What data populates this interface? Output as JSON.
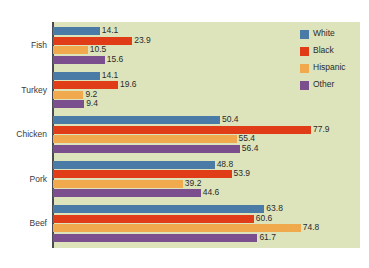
{
  "chart_data": {
    "type": "bar",
    "orientation": "horizontal",
    "title": "",
    "xlabel": "",
    "ylabel": "",
    "categories": [
      "Fish",
      "Turkey",
      "Chicken",
      "Pork",
      "Beef"
    ],
    "series": [
      {
        "name": "White",
        "color": "#4a7ba7",
        "values": [
          14.1,
          14.1,
          50.4,
          48.8,
          63.8
        ]
      },
      {
        "name": "Black",
        "color": "#e03c18",
        "values": [
          23.9,
          19.6,
          77.9,
          53.9,
          60.6
        ]
      },
      {
        "name": "Hispanic",
        "color": "#f0a94c",
        "values": [
          10.5,
          9.2,
          55.4,
          39.2,
          74.8
        ]
      },
      {
        "name": "Other",
        "color": "#7b4f8e",
        "values": [
          15.6,
          9.4,
          56.4,
          44.6,
          61.7
        ]
      }
    ],
    "xlim": [
      0,
      80
    ],
    "grid": false,
    "legend_position": "top-right",
    "plot_background": "#dde4bc",
    "data_labels": true
  },
  "legend": {
    "items": [
      {
        "label": "White",
        "color": "#4a7ba7"
      },
      {
        "label": "Black",
        "color": "#e03c18"
      },
      {
        "label": "Hispanic",
        "color": "#f0a94c"
      },
      {
        "label": "Other",
        "color": "#7b4f8e"
      }
    ]
  },
  "caption": {
    "text": ""
  }
}
